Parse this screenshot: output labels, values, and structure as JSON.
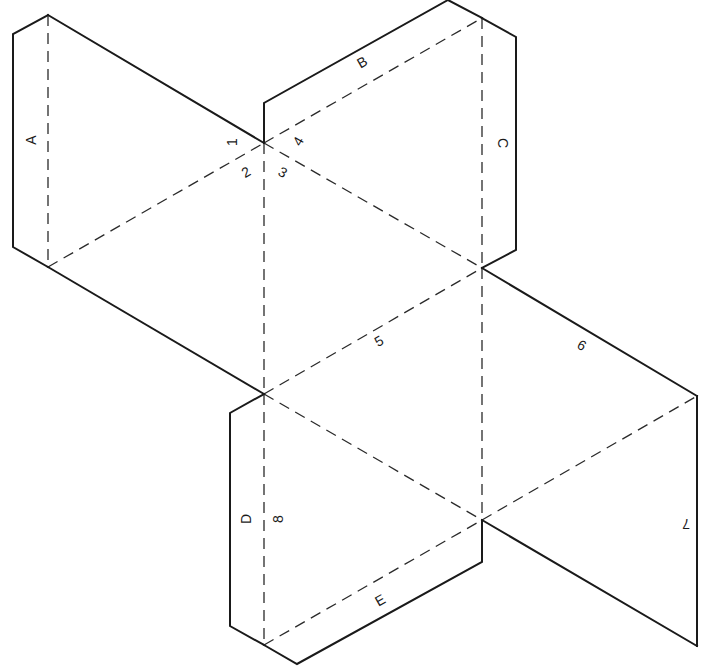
{
  "diagram": {
    "width": 711,
    "height": 671,
    "colors": {
      "line": "#1a1a1a",
      "fold": "#2a2a2a",
      "background": "#ffffff"
    },
    "vertices": {
      "a_top": [
        48,
        15
      ],
      "a_bot": [
        48,
        267
      ],
      "c1": [
        264,
        143
      ],
      "bc_top": [
        482,
        18
      ],
      "c2": [
        482,
        268
      ],
      "c3": [
        264,
        394
      ],
      "c4": [
        482,
        520
      ],
      "r_top": [
        697,
        396
      ],
      "r_bot": [
        697,
        646
      ],
      "bottom": [
        264,
        645
      ]
    },
    "cut_lines": [
      {
        "name": "tab-a-outline",
        "points": [
          [
            48,
            15
          ],
          [
            13,
            34
          ],
          [
            13,
            247
          ],
          [
            48,
            267
          ]
        ]
      },
      {
        "name": "edge-1",
        "points": [
          [
            48,
            15
          ],
          [
            264,
            143
          ]
        ]
      },
      {
        "name": "edge-lower-left",
        "points": [
          [
            48,
            267
          ],
          [
            264,
            394
          ]
        ]
      },
      {
        "name": "tab-b-outline",
        "points": [
          [
            264,
            143
          ],
          [
            264,
            103
          ],
          [
            448,
            0
          ],
          [
            482,
            18
          ]
        ]
      },
      {
        "name": "tab-c-outline",
        "points": [
          [
            482,
            18
          ],
          [
            516,
            37
          ],
          [
            516,
            250
          ],
          [
            482,
            268
          ]
        ]
      },
      {
        "name": "edge-6",
        "points": [
          [
            482,
            268
          ],
          [
            697,
            396
          ]
        ]
      },
      {
        "name": "edge-7",
        "points": [
          [
            697,
            396
          ],
          [
            697,
            646
          ]
        ]
      },
      {
        "name": "edge-lower-right",
        "points": [
          [
            697,
            646
          ],
          [
            482,
            520
          ]
        ]
      },
      {
        "name": "tab-e-outline",
        "points": [
          [
            482,
            520
          ],
          [
            482,
            562
          ],
          [
            297,
            664
          ],
          [
            264,
            645
          ]
        ]
      },
      {
        "name": "tab-d-outline",
        "points": [
          [
            264,
            645
          ],
          [
            230,
            626
          ],
          [
            230,
            413
          ],
          [
            264,
            394
          ]
        ]
      }
    ],
    "fold_lines": [
      {
        "name": "fold-a",
        "points": [
          [
            48,
            15
          ],
          [
            48,
            267
          ]
        ]
      },
      {
        "name": "fold-2",
        "points": [
          [
            48,
            267
          ],
          [
            264,
            143
          ]
        ]
      },
      {
        "name": "fold-b",
        "points": [
          [
            264,
            143
          ],
          [
            482,
            18
          ]
        ]
      },
      {
        "name": "fold-c",
        "points": [
          [
            482,
            18
          ],
          [
            482,
            268
          ]
        ]
      },
      {
        "name": "fold-3",
        "points": [
          [
            264,
            143
          ],
          [
            482,
            268
          ]
        ]
      },
      {
        "name": "fold-8-upper",
        "points": [
          [
            264,
            143
          ],
          [
            264,
            394
          ]
        ]
      },
      {
        "name": "fold-5",
        "points": [
          [
            264,
            394
          ],
          [
            482,
            268
          ]
        ]
      },
      {
        "name": "fold-center-vertical",
        "points": [
          [
            482,
            268
          ],
          [
            482,
            520
          ]
        ]
      },
      {
        "name": "fold-right-diagonal",
        "points": [
          [
            482,
            520
          ],
          [
            697,
            396
          ]
        ]
      },
      {
        "name": "fold-lower-diagonal",
        "points": [
          [
            264,
            394
          ],
          [
            482,
            520
          ]
        ]
      },
      {
        "name": "fold-8-lower",
        "points": [
          [
            264,
            394
          ],
          [
            264,
            645
          ]
        ]
      },
      {
        "name": "fold-e",
        "points": [
          [
            264,
            645
          ],
          [
            482,
            520
          ]
        ]
      }
    ],
    "labels": [
      {
        "name": "tab-label-a",
        "text": "A",
        "x": 31,
        "y": 140,
        "rotate": -90
      },
      {
        "name": "tab-label-b",
        "text": "B",
        "x": 362,
        "y": 62,
        "rotate": -30
      },
      {
        "name": "tab-label-c",
        "text": "C",
        "x": 503,
        "y": 143,
        "rotate": 90
      },
      {
        "name": "tab-label-d",
        "text": "D",
        "x": 246,
        "y": 519,
        "rotate": -90
      },
      {
        "name": "tab-label-e",
        "text": "E",
        "x": 380,
        "y": 600,
        "rotate": -30
      },
      {
        "name": "edge-label-1",
        "text": "1",
        "x": 232,
        "y": 142,
        "rotate": -90
      },
      {
        "name": "edge-label-2",
        "text": "2",
        "x": 246,
        "y": 172,
        "rotate": -30
      },
      {
        "name": "edge-label-3",
        "text": "3",
        "x": 283,
        "y": 172,
        "rotate": 30
      },
      {
        "name": "edge-label-4",
        "text": "4",
        "x": 298,
        "y": 141,
        "rotate": -60
      },
      {
        "name": "edge-label-5",
        "text": "5",
        "x": 379,
        "y": 341,
        "rotate": -30
      },
      {
        "name": "edge-label-6",
        "text": "6",
        "x": 582,
        "y": 345,
        "rotate": 30
      },
      {
        "name": "edge-label-7",
        "text": "7",
        "x": 686,
        "y": 524,
        "rotate": 180
      },
      {
        "name": "edge-label-8",
        "text": "8",
        "x": 278,
        "y": 519,
        "rotate": -90
      }
    ]
  }
}
